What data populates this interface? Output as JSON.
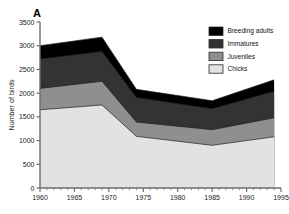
{
  "figure": {
    "panel_label": "A"
  },
  "chart_data": {
    "type": "area",
    "stacked": true,
    "title": "",
    "xlabel": "",
    "ylabel": "Number of birds",
    "xlim": [
      1960,
      1995
    ],
    "ylim": [
      0,
      3500
    ],
    "grid": false,
    "legend_position": "top-right",
    "x_major_ticks": [
      1960,
      1965,
      1970,
      1975,
      1980,
      1985,
      1990,
      1995
    ],
    "x_tick_labels": [
      "1960",
      "1965",
      "1970",
      "1975",
      "1980",
      "1985",
      "1990",
      "1995"
    ],
    "x_minor_tick_step": 1,
    "y_ticks": [
      0,
      500,
      1000,
      1500,
      2000,
      2500,
      3000,
      3500
    ],
    "y_tick_labels": [
      "0",
      "500",
      "1000",
      "1500",
      "2000",
      "2500",
      "3000",
      "3500"
    ],
    "x": [
      1960,
      1969,
      1974,
      1985,
      1994
    ],
    "series": [
      {
        "name": "Chicks",
        "color": "#e2e2e2",
        "values": [
          1650,
          1750,
          1090,
          900,
          1080
        ]
      },
      {
        "name": "Juveniles",
        "color": "#8f8f8f",
        "values": [
          450,
          500,
          300,
          330,
          400
        ]
      },
      {
        "name": "Immatures",
        "color": "#333333",
        "values": [
          620,
          630,
          520,
          440,
          560
        ]
      },
      {
        "name": "Breeding adults",
        "color": "#000000",
        "values": [
          280,
          300,
          170,
          170,
          240
        ]
      }
    ],
    "cumulative_tops": {
      "chicks": [
        1650,
        1750,
        1090,
        900,
        1080
      ],
      "juveniles": [
        2100,
        2250,
        1390,
        1230,
        1480
      ],
      "immatures": [
        2720,
        2880,
        1910,
        1670,
        2040
      ],
      "breeding_adults": [
        3000,
        3180,
        2080,
        1840,
        2280
      ]
    },
    "legend": [
      {
        "label": "Breeding adults",
        "color": "#000000"
      },
      {
        "label": "Immatures",
        "color": "#333333"
      },
      {
        "label": "Juveniles",
        "color": "#8f8f8f"
      },
      {
        "label": "Chicks",
        "color": "#e2e2e2"
      }
    ]
  }
}
